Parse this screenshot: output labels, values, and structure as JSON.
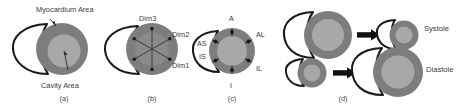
{
  "figure": {
    "annotations": {
      "myocardium": "Myocardium Area",
      "cavity": "Cavity Area"
    },
    "panels": [
      {
        "id": "a",
        "caption": "(a)"
      },
      {
        "id": "b",
        "caption": "(b)"
      },
      {
        "id": "c",
        "caption": "(c)"
      },
      {
        "id": "d",
        "caption": "(d)"
      }
    ],
    "dimensions": [
      {
        "key": "dim3",
        "label": "Dim3"
      },
      {
        "key": "dim2",
        "label": "Dim2"
      },
      {
        "key": "dim1",
        "label": "Dim1"
      }
    ],
    "segments": [
      {
        "key": "anterior",
        "label": "A"
      },
      {
        "key": "anterolateral",
        "label": "AL"
      },
      {
        "key": "inferolateral",
        "label": "IL"
      },
      {
        "key": "inferior",
        "label": "I"
      },
      {
        "key": "inferoseptal",
        "label": "IS"
      },
      {
        "key": "anteroseptal",
        "label": "AS"
      }
    ],
    "phases": [
      {
        "key": "systole",
        "label": "Systole"
      },
      {
        "key": "diastole",
        "label": "Diastole"
      }
    ],
    "colors": {
      "myocardium": "#7d7d7d",
      "cavity": "#a8a8a8",
      "outline": "#1a1a1a",
      "arrow": "#111111",
      "text": "#3a3a3a",
      "background": "#ffffff"
    }
  }
}
